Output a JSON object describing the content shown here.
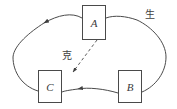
{
  "diagram": {
    "type": "cycle-diagram",
    "title": "",
    "background_color": "#ffffff",
    "stroke_color": "#4a4a4a",
    "text_color": "#3a3a3a",
    "nodes": [
      {
        "id": "A",
        "label": "A",
        "x": 82,
        "y": 5,
        "width": 24,
        "height": 35
      },
      {
        "id": "C",
        "label": "C",
        "x": 38,
        "y": 70,
        "width": 24,
        "height": 33
      },
      {
        "id": "B",
        "label": "B",
        "x": 118,
        "y": 70,
        "width": 24,
        "height": 33
      }
    ],
    "edges": [
      {
        "id": "sheng-cycle",
        "label": "生",
        "style": "solid",
        "shape": "ellipse-arc",
        "from": "B",
        "to": "A",
        "arrowheads": [
          "upper-left-arc",
          "lower-left-arc"
        ]
      },
      {
        "id": "ke-link",
        "label": "克",
        "style": "dashed",
        "shape": "straight",
        "from": "A",
        "to": "C",
        "arrowheads": [
          "at-c"
        ]
      }
    ],
    "labels": {
      "sheng": "生",
      "ke": "克"
    }
  }
}
